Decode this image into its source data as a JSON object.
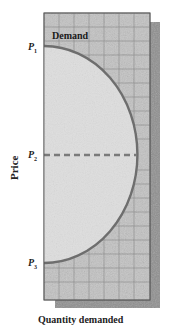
{
  "diagram": {
    "curve_label": "Demand",
    "y_axis_label": "Price",
    "x_axis_label": "Quantity demanded",
    "price_labels": [
      {
        "letter": "P",
        "sub": "1"
      },
      {
        "letter": "P",
        "sub": "2"
      },
      {
        "letter": "P",
        "sub": "3"
      }
    ],
    "colors": {
      "panel": "#bdbdbd",
      "shadow": "#8f8f8f",
      "inner_area": "#dcdcdc",
      "curve": "#6e6e6e",
      "grid": "#7a7a7a",
      "dashed_line": "#7a7a7a"
    }
  }
}
